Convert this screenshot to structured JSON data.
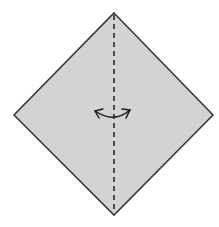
{
  "canvas": {
    "width": 219,
    "height": 227,
    "background_color": "#ffffff"
  },
  "figure": {
    "paper": {
      "name": "square-paper-diamond",
      "fill_color": "#d3d3d3",
      "stroke_color": "#3a3a3a",
      "stroke_width": 1.6,
      "vertices": [
        {
          "label": "top",
          "x": 114,
          "y": 13
        },
        {
          "label": "right",
          "x": 213,
          "y": 115
        },
        {
          "label": "bottom",
          "x": 114,
          "y": 215
        },
        {
          "label": "left",
          "x": 14,
          "y": 115
        }
      ],
      "points_attr": "114,13 213,115 114,215 14,115"
    },
    "fold_line": {
      "name": "valley-fold-dashed-line",
      "type": "dashed",
      "orientation": "vertical",
      "x": 114,
      "y_start": 15,
      "y_end": 213,
      "stroke_color": "#2b2b2b",
      "stroke_width": 1.6,
      "dash_pattern": "5,4"
    },
    "arrow": {
      "name": "double-headed-fold-arrow",
      "type": "arc-double-arrow",
      "stroke_color": "#1a1a1a",
      "stroke_width": 1.5,
      "arc_path": "M 95,111 Q 114,124 130,110",
      "head_left_path": "M 95,111 L 103,109 M 95,111 L 99,118",
      "head_right_path": "M 130,110 L 122,109 M 130,110 L 126,118",
      "span_x_start": 93,
      "span_x_end": 131,
      "center_y": 114
    }
  }
}
